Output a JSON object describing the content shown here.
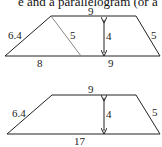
{
  "caption": "e and a parallelogram (or a",
  "figure_top": {
    "top_label": "9",
    "left_side_label": "6.4",
    "diagonal_label": "5",
    "height_label": "4",
    "right_side_label": "5",
    "bottom_left_label": "8",
    "bottom_right_label": "9"
  },
  "figure_bottom": {
    "top_label": "9",
    "left_side_label": "6.4",
    "height_label": "4",
    "right_side_label": "5",
    "bottom_label": "17"
  }
}
